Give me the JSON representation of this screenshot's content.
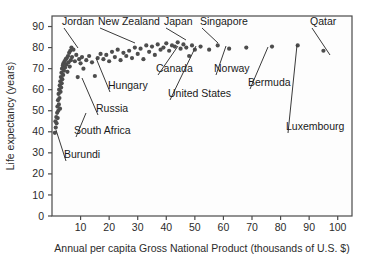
{
  "chart_data": {
    "type": "scatter",
    "title": "",
    "xlabel": "Annual per capita Gross National Product (thousands of U.S. $)",
    "ylabel": "Life expectancy (years)",
    "xlim": [
      0,
      105
    ],
    "ylim": [
      0,
      95
    ],
    "xticks": [
      10,
      20,
      30,
      40,
      50,
      60,
      70,
      80,
      90,
      100
    ],
    "yticks": [
      0,
      10,
      20,
      30,
      40,
      50,
      60,
      70,
      80,
      90
    ],
    "grid": true,
    "legend": "none",
    "marker_color": "#4d4d4d",
    "points": [
      {
        "x": 1.0,
        "y": 39.5
      },
      {
        "x": 1.2,
        "y": 45.0
      },
      {
        "x": 1.3,
        "y": 42.0
      },
      {
        "x": 1.5,
        "y": 47.0
      },
      {
        "x": 1.6,
        "y": 44.0
      },
      {
        "x": 1.8,
        "y": 49.0
      },
      {
        "x": 1.9,
        "y": 52.0
      },
      {
        "x": 2.0,
        "y": 46.5
      },
      {
        "x": 2.1,
        "y": 55.0
      },
      {
        "x": 2.2,
        "y": 50.0
      },
      {
        "x": 2.3,
        "y": 58.0
      },
      {
        "x": 2.4,
        "y": 53.0
      },
      {
        "x": 2.5,
        "y": 60.0
      },
      {
        "x": 2.6,
        "y": 56.0
      },
      {
        "x": 2.7,
        "y": 62.0
      },
      {
        "x": 2.8,
        "y": 51.0
      },
      {
        "x": 2.9,
        "y": 64.0
      },
      {
        "x": 3.0,
        "y": 59.0
      },
      {
        "x": 3.1,
        "y": 66.0
      },
      {
        "x": 3.2,
        "y": 61.0
      },
      {
        "x": 3.3,
        "y": 68.0
      },
      {
        "x": 3.4,
        "y": 63.0
      },
      {
        "x": 3.5,
        "y": 70.0
      },
      {
        "x": 3.6,
        "y": 65.0
      },
      {
        "x": 3.8,
        "y": 71.5
      },
      {
        "x": 3.9,
        "y": 67.0
      },
      {
        "x": 4.0,
        "y": 72.5
      },
      {
        "x": 4.2,
        "y": 69.0
      },
      {
        "x": 4.4,
        "y": 73.5
      },
      {
        "x": 4.6,
        "y": 70.5
      },
      {
        "x": 4.8,
        "y": 74.5
      },
      {
        "x": 5.0,
        "y": 72.0
      },
      {
        "x": 5.2,
        "y": 75.0
      },
      {
        "x": 5.4,
        "y": 68.5
      },
      {
        "x": 5.6,
        "y": 76.0
      },
      {
        "x": 5.8,
        "y": 73.0
      },
      {
        "x": 6.0,
        "y": 77.5
      },
      {
        "x": 6.2,
        "y": 71.0
      },
      {
        "x": 6.4,
        "y": 78.5
      },
      {
        "x": 6.6,
        "y": 74.0
      },
      {
        "x": 6.8,
        "y": 80.0
      },
      {
        "x": 7.0,
        "y": 75.5
      },
      {
        "x": 7.5,
        "y": 79.0
      },
      {
        "x": 8.0,
        "y": 73.5
      },
      {
        "x": 8.5,
        "y": 76.5
      },
      {
        "x": 9.0,
        "y": 66.0
      },
      {
        "x": 9.5,
        "y": 74.5
      },
      {
        "x": 10.0,
        "y": 72.5
      },
      {
        "x": 10.5,
        "y": 75.5
      },
      {
        "x": 11.0,
        "y": 70.0
      },
      {
        "x": 12.0,
        "y": 74.0
      },
      {
        "x": 13.0,
        "y": 76.0
      },
      {
        "x": 14.0,
        "y": 73.0
      },
      {
        "x": 15.0,
        "y": 66.5
      },
      {
        "x": 16.0,
        "y": 75.0
      },
      {
        "x": 17.0,
        "y": 77.0
      },
      {
        "x": 18.0,
        "y": 74.5
      },
      {
        "x": 19.0,
        "y": 76.5
      },
      {
        "x": 20.0,
        "y": 73.5
      },
      {
        "x": 21.0,
        "y": 78.0
      },
      {
        "x": 22.0,
        "y": 75.5
      },
      {
        "x": 23.0,
        "y": 79.0
      },
      {
        "x": 24.0,
        "y": 74.0
      },
      {
        "x": 25.0,
        "y": 77.5
      },
      {
        "x": 26.0,
        "y": 76.0
      },
      {
        "x": 27.0,
        "y": 78.5
      },
      {
        "x": 28.0,
        "y": 75.0
      },
      {
        "x": 29.0,
        "y": 80.0
      },
      {
        "x": 30.0,
        "y": 77.0
      },
      {
        "x": 31.0,
        "y": 79.5
      },
      {
        "x": 32.0,
        "y": 74.5
      },
      {
        "x": 33.0,
        "y": 81.0
      },
      {
        "x": 34.0,
        "y": 78.0
      },
      {
        "x": 35.0,
        "y": 80.5
      },
      {
        "x": 36.0,
        "y": 76.5
      },
      {
        "x": 37.0,
        "y": 81.5
      },
      {
        "x": 38.0,
        "y": 79.0
      },
      {
        "x": 39.0,
        "y": 80.0
      },
      {
        "x": 40.0,
        "y": 82.0
      },
      {
        "x": 41.0,
        "y": 78.5
      },
      {
        "x": 42.0,
        "y": 81.0
      },
      {
        "x": 43.0,
        "y": 80.5
      },
      {
        "x": 44.0,
        "y": 82.5
      },
      {
        "x": 45.0,
        "y": 79.5
      },
      {
        "x": 46.0,
        "y": 81.5
      },
      {
        "x": 47.0,
        "y": 80.0
      },
      {
        "x": 48.0,
        "y": 76.0
      },
      {
        "x": 49.0,
        "y": 81.0
      },
      {
        "x": 50.0,
        "y": 79.0
      },
      {
        "x": 52.0,
        "y": 80.5
      },
      {
        "x": 55.0,
        "y": 79.0
      },
      {
        "x": 58.0,
        "y": 81.0
      },
      {
        "x": 62.0,
        "y": 79.5
      },
      {
        "x": 68.0,
        "y": 80.0
      },
      {
        "x": 77.0,
        "y": 80.5
      },
      {
        "x": 86.0,
        "y": 81.0
      },
      {
        "x": 95.0,
        "y": 78.5
      }
    ],
    "annotations": [
      {
        "label": "Jordan",
        "lx": 62,
        "ly": 25,
        "px": 78,
        "py": 48,
        "anchor": "start"
      },
      {
        "label": "New Zealand",
        "lx": 98,
        "ly": 25,
        "px": 135,
        "py": 43,
        "anchor": "start"
      },
      {
        "label": "Japan",
        "lx": 164,
        "ly": 25,
        "px": 186,
        "py": 40,
        "anchor": "start"
      },
      {
        "label": "Singapore",
        "lx": 200,
        "ly": 25,
        "px": 218,
        "py": 43,
        "anchor": "start"
      },
      {
        "label": "Qatar",
        "lx": 310,
        "ly": 25,
        "px": 330,
        "py": 55,
        "anchor": "start"
      },
      {
        "label": "Canada",
        "lx": 156,
        "ly": 72,
        "px": 178,
        "py": 46,
        "anchor": "start"
      },
      {
        "label": "Norway",
        "lx": 214,
        "ly": 72,
        "px": 226,
        "py": 46,
        "anchor": "start"
      },
      {
        "label": "Bermuda",
        "lx": 248,
        "ly": 86,
        "px": 268,
        "py": 47,
        "anchor": "start"
      },
      {
        "label": "Hungary",
        "lx": 108,
        "ly": 89,
        "px": 96,
        "py": 58,
        "anchor": "start"
      },
      {
        "label": "United States",
        "lx": 168,
        "ly": 97,
        "px": 196,
        "py": 46,
        "anchor": "start"
      },
      {
        "label": "Luxembourg",
        "lx": 286,
        "ly": 130,
        "px": 297,
        "py": 45,
        "anchor": "start"
      },
      {
        "label": "Russia",
        "lx": 96,
        "ly": 112,
        "px": 82,
        "py": 78,
        "anchor": "start"
      },
      {
        "label": "South Africa",
        "lx": 74,
        "ly": 134,
        "px": 86,
        "py": 113,
        "anchor": "start"
      },
      {
        "label": "Burundi",
        "lx": 64,
        "ly": 158,
        "px": 56,
        "py": 130,
        "anchor": "start"
      }
    ]
  }
}
